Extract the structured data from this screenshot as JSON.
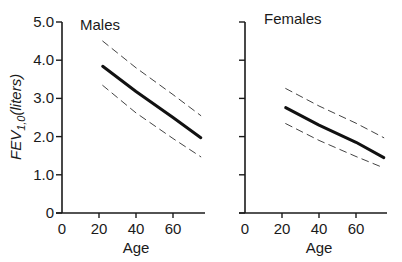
{
  "chart_data": [
    {
      "type": "line",
      "title": "Males",
      "xlabel": "Age",
      "ylabel": "FEV1,0 (liters)",
      "x_ticks": [
        "0",
        "20",
        "40",
        "60"
      ],
      "y_ticks": [
        "0",
        "1.0",
        "2.0",
        "3.0",
        "4.0",
        "5.0"
      ],
      "xlim": [
        0,
        78
      ],
      "ylim": [
        0,
        5.0
      ],
      "grid": false,
      "x": [
        22,
        40,
        60,
        75
      ],
      "series": [
        {
          "name": "mean",
          "style": "solid",
          "values": [
            3.84,
            3.18,
            2.5,
            1.97
          ]
        },
        {
          "name": "upper limit",
          "style": "dashed",
          "values": [
            4.5,
            3.8,
            3.1,
            2.55
          ]
        },
        {
          "name": "lower limit",
          "style": "dashed",
          "values": [
            3.34,
            2.62,
            1.95,
            1.47
          ]
        }
      ]
    },
    {
      "type": "line",
      "title": "Females",
      "xlabel": "Age",
      "ylabel": "",
      "x_ticks": [
        "0",
        "20",
        "40",
        "60"
      ],
      "y_ticks": [],
      "xlim": [
        0,
        78
      ],
      "ylim": [
        0,
        5.0
      ],
      "grid": false,
      "x": [
        22,
        40,
        60,
        75
      ],
      "series": [
        {
          "name": "mean",
          "style": "solid",
          "values": [
            2.76,
            2.3,
            1.85,
            1.45
          ]
        },
        {
          "name": "upper limit",
          "style": "dashed",
          "values": [
            3.26,
            2.8,
            2.35,
            1.97
          ]
        },
        {
          "name": "lower limit",
          "style": "dashed",
          "values": [
            2.34,
            1.9,
            1.48,
            1.18
          ]
        }
      ]
    }
  ],
  "labels": {
    "ylabel_main": "FEV",
    "ylabel_sub": "1,0",
    "ylabel_rest": "(liters)"
  }
}
